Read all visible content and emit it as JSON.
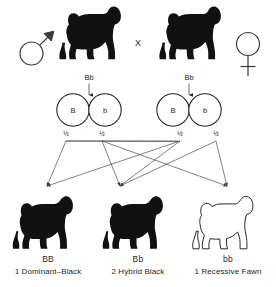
{
  "symbols": {
    "male": "male-symbol",
    "female": "female-symbol",
    "cross_operator": "X"
  },
  "parents": {
    "left": {
      "sex": "male",
      "genotype": "Bb",
      "phenotype_color": "#111111"
    },
    "right": {
      "sex": "female",
      "genotype": "Bb",
      "phenotype_color": "#111111"
    }
  },
  "gametes": [
    {
      "allele": "B",
      "probability": "½"
    },
    {
      "allele": "b",
      "probability": "½"
    },
    {
      "allele": "B",
      "probability": "½"
    },
    {
      "allele": "b",
      "probability": "½"
    }
  ],
  "offspring": [
    {
      "genotype": "BB",
      "caption": "1 Dominant–Black",
      "ratio": 1,
      "phenotype": "Dominant-Black",
      "fill": "solid",
      "color": "#111111"
    },
    {
      "genotype": "Bb",
      "caption": "2 Hybrid Black",
      "ratio": 2,
      "phenotype": "Hybrid Black",
      "fill": "solid",
      "color": "#111111"
    },
    {
      "genotype": "bb",
      "caption": "1 Recessive Fawn",
      "ratio": 1,
      "phenotype": "Recessive Fawn",
      "fill": "outline",
      "color": "#ffffff"
    }
  ],
  "colors": {
    "ink": "#1a1a1a",
    "line": "#3d3d3d",
    "background": "#ffffff"
  }
}
